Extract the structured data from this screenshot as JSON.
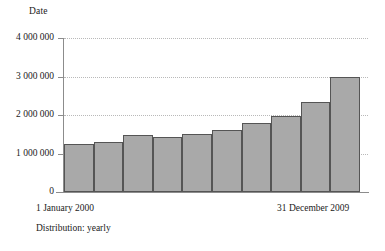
{
  "chart_data": {
    "type": "bar",
    "title": "",
    "ylabel": "Date",
    "xlabel": "",
    "ylim": [
      0,
      4000000
    ],
    "grid": true,
    "legend": null,
    "categories": [
      "2000",
      "2001",
      "2002",
      "2003",
      "2004",
      "2005",
      "2006",
      "2007",
      "2008",
      "2009"
    ],
    "values": [
      1250000,
      1300000,
      1480000,
      1440000,
      1500000,
      1620000,
      1800000,
      1970000,
      2330000,
      3000000
    ],
    "ytick_labels": [
      "0",
      "1 000 000",
      "2 000 000",
      "3 000 000",
      "4 000 000"
    ],
    "ytick_values": [
      0,
      1000000,
      2000000,
      3000000,
      4000000
    ],
    "x_range_start_label": "1 January 2000",
    "x_range_end_label": "31 December 2009",
    "annotation": "Distribution: yearly",
    "bar_fill_color": "#a9a9a9",
    "bar_edge_color": "#555555",
    "grid_color": "#b9b9b9",
    "axis_color": "#8c8c8c"
  },
  "axis": {
    "y_title": "Date"
  },
  "footer": {
    "left_label": "1 January 2000",
    "right_label": "31 December 2009",
    "distribution": "Distribution: yearly"
  }
}
